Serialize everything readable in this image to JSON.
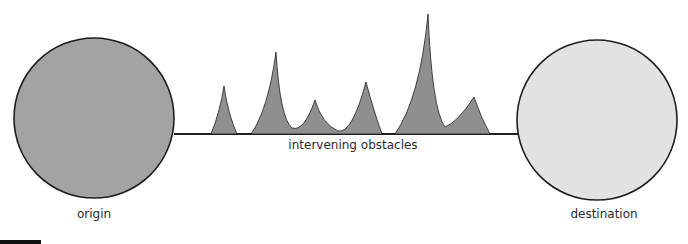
{
  "diagram": {
    "labels": {
      "origin": "origin",
      "destination": "destination",
      "obstacles": "intervening obstacles"
    },
    "colors": {
      "origin_fill": "#a3a3a3",
      "destination_fill": "#e2e2e2",
      "obstacle_fill": "#8f8f8f",
      "stroke": "#1e1e1e",
      "text": "#2a2a2a"
    },
    "nodes": [
      {
        "id": "origin",
        "cx": 94,
        "cy": 118,
        "r": 80
      },
      {
        "id": "destination",
        "cx": 597,
        "cy": 120,
        "r": 80
      }
    ],
    "baseline": {
      "x1": 174,
      "x2": 518,
      "y": 134
    },
    "obstacles": [
      {
        "id": "obstacle-1",
        "peaks": [
          {
            "x": 224,
            "y": 86
          }
        ]
      },
      {
        "id": "obstacle-2",
        "peaks": [
          {
            "x": 276,
            "y": 52
          },
          {
            "x": 315,
            "y": 100
          },
          {
            "x": 366,
            "y": 82
          }
        ]
      },
      {
        "id": "obstacle-3",
        "peaks": [
          {
            "x": 428,
            "y": 14
          },
          {
            "x": 474,
            "y": 97
          }
        ]
      }
    ]
  }
}
